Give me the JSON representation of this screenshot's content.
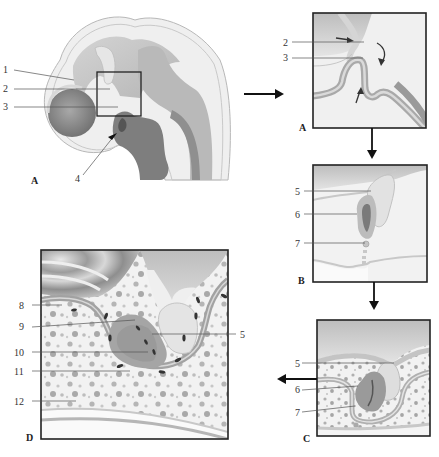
{
  "figure": {
    "panels": [
      {
        "id": "A_overview",
        "letter": "A",
        "labels": [
          "1",
          "2",
          "3",
          "4"
        ]
      },
      {
        "id": "A_inset",
        "letter": "A",
        "labels": [
          "2",
          "3"
        ]
      },
      {
        "id": "B",
        "letter": "B",
        "labels": [
          "5",
          "6",
          "7"
        ]
      },
      {
        "id": "C",
        "letter": "C",
        "labels": [
          "5",
          "6",
          "7"
        ]
      },
      {
        "id": "D",
        "letter": "D",
        "labels": [
          "8",
          "9",
          "10",
          "11",
          "12",
          "5"
        ]
      }
    ],
    "flow_arrows": [
      "A overview → A inset",
      "A inset → B",
      "B → C",
      "C → D"
    ]
  },
  "panelA": {
    "letter": "A",
    "l1": "1",
    "l2": "2",
    "l3": "3",
    "l4": "4"
  },
  "insetA": {
    "letter": "A",
    "l2": "2",
    "l3": "3"
  },
  "panelB": {
    "letter": "B",
    "l5": "5",
    "l6": "6",
    "l7": "7"
  },
  "panelC": {
    "letter": "C",
    "l5": "5",
    "l6": "6",
    "l7": "7"
  },
  "panelD": {
    "letter": "D",
    "l8": "8",
    "l9": "9",
    "l10": "10",
    "l11": "11",
    "l12": "12",
    "l5": "5"
  },
  "colors": {
    "tissue_light": "#ececec",
    "tissue_mid": "#c9c9c9",
    "tissue_dark": "#9a9a9a",
    "frame": "#222222"
  }
}
